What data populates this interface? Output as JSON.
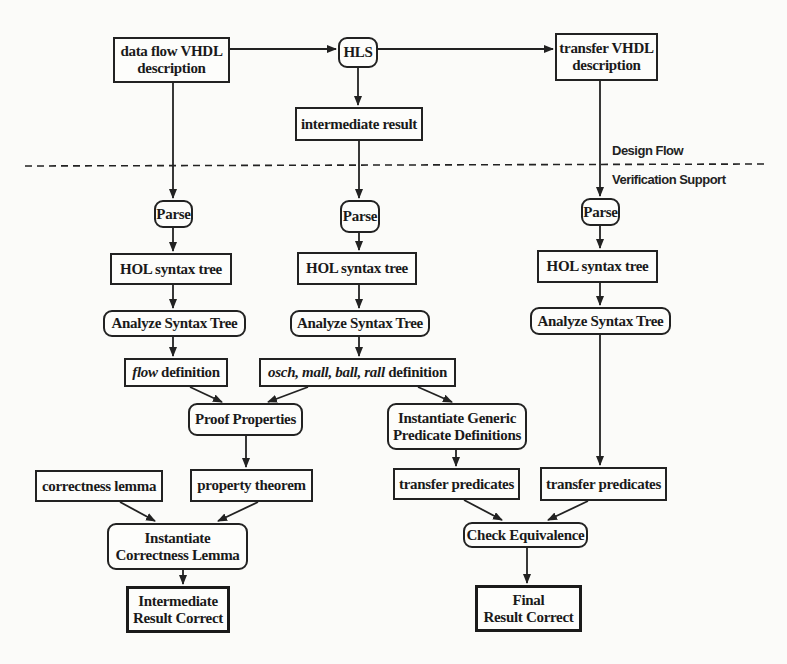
{
  "diagram": {
    "section_labels": {
      "upper": "Design Flow",
      "lower": "Verification Support"
    },
    "nodes": {
      "dataflow_vhdl": {
        "line1": "data flow VHDL",
        "line2": "description"
      },
      "hls": {
        "text": "HLS"
      },
      "transfer_vhdl": {
        "line1": "transfer VHDL",
        "line2": "description"
      },
      "intermediate_result": {
        "text": "intermediate result"
      },
      "parse_left": {
        "text": "Parse"
      },
      "parse_mid": {
        "text": "Parse"
      },
      "parse_right": {
        "text": "Parse"
      },
      "hol_left": {
        "text": "HOL syntax tree"
      },
      "hol_mid": {
        "text": "HOL syntax tree"
      },
      "hol_right": {
        "text": "HOL syntax tree"
      },
      "analyze_left": {
        "text": "Analyze Syntax Tree"
      },
      "analyze_mid": {
        "text": "Analyze Syntax Tree"
      },
      "analyze_right": {
        "text": "Analyze Syntax Tree"
      },
      "flow_definition": {
        "italic": "flow",
        "rest": " definition"
      },
      "osch_definition": {
        "italic": "osch, mall, ball, rall",
        "rest": " definition"
      },
      "proof_properties": {
        "text": "Proof Properties"
      },
      "instantiate_generic": {
        "line1": "Instantiate Generic",
        "line2": "Predicate Definitions"
      },
      "correctness_lemma": {
        "text": "correctness lemma"
      },
      "property_theorem": {
        "text": "property theorem"
      },
      "transfer_predicates_mid": {
        "text": "transfer predicates"
      },
      "transfer_predicates_right": {
        "text": "transfer predicates"
      },
      "instantiate_correctness": {
        "line1": "Instantiate",
        "line2": "Correctness Lemma"
      },
      "check_equivalence": {
        "text": "Check Equivalence"
      },
      "intermediate_correct": {
        "line1": "Intermediate",
        "line2": "Result Correct"
      },
      "final_correct": {
        "line1": "Final",
        "line2": "Result Correct"
      }
    },
    "edges": [
      [
        "dataflow_vhdl",
        "hls"
      ],
      [
        "hls",
        "transfer_vhdl"
      ],
      [
        "hls",
        "intermediate_result"
      ],
      [
        "dataflow_vhdl",
        "parse_left"
      ],
      [
        "intermediate_result",
        "parse_mid"
      ],
      [
        "transfer_vhdl",
        "parse_right"
      ],
      [
        "parse_left",
        "hol_left"
      ],
      [
        "parse_mid",
        "hol_mid"
      ],
      [
        "parse_right",
        "hol_right"
      ],
      [
        "hol_left",
        "analyze_left"
      ],
      [
        "hol_mid",
        "analyze_mid"
      ],
      [
        "hol_right",
        "analyze_right"
      ],
      [
        "analyze_left",
        "flow_definition"
      ],
      [
        "analyze_mid",
        "osch_definition"
      ],
      [
        "flow_definition",
        "proof_properties"
      ],
      [
        "osch_definition",
        "proof_properties"
      ],
      [
        "osch_definition",
        "instantiate_generic"
      ],
      [
        "proof_properties",
        "property_theorem"
      ],
      [
        "instantiate_generic",
        "transfer_predicates_mid"
      ],
      [
        "analyze_right",
        "transfer_predicates_right"
      ],
      [
        "correctness_lemma",
        "instantiate_correctness"
      ],
      [
        "property_theorem",
        "instantiate_correctness"
      ],
      [
        "transfer_predicates_mid",
        "check_equivalence"
      ],
      [
        "transfer_predicates_right",
        "check_equivalence"
      ],
      [
        "instantiate_correctness",
        "intermediate_correct"
      ],
      [
        "check_equivalence",
        "final_correct"
      ]
    ]
  }
}
